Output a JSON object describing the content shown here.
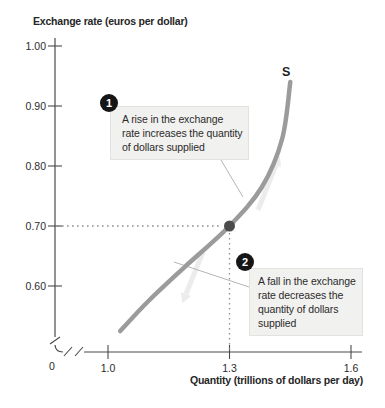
{
  "figure": {
    "y_axis_title": "Exchange rate (euros per dollar)",
    "x_axis_title": "Quantity (trillions of dollars per day)",
    "curve_label": "S",
    "origin_label": "0",
    "annotations": [
      {
        "number": "1",
        "lines": [
          "A rise in the exchange",
          "rate increases the quantity",
          "of dollars supplied"
        ]
      },
      {
        "number": "2",
        "lines": [
          "A fall in the exchange",
          "rate decreases the",
          "quantity of dollars",
          "supplied"
        ]
      }
    ]
  },
  "chart_data": {
    "type": "line",
    "title": "",
    "xlabel": "Quantity (trillions of dollars per day)",
    "ylabel": "Exchange rate (euros per dollar)",
    "xlim": [
      1.0,
      1.6
    ],
    "ylim": [
      0.55,
      1.0
    ],
    "axis_break": true,
    "grid": false,
    "x_ticks": [
      {
        "value": 1.0,
        "label": "1.0"
      },
      {
        "value": 1.3,
        "label": "1.3"
      },
      {
        "value": 1.6,
        "label": "1.6"
      }
    ],
    "y_ticks": [
      {
        "value": 1.0,
        "label": "1.00"
      },
      {
        "value": 0.9,
        "label": "0.90"
      },
      {
        "value": 0.8,
        "label": "0.80"
      },
      {
        "value": 0.7,
        "label": "0.70"
      },
      {
        "value": 0.6,
        "label": "0.60"
      }
    ],
    "series": [
      {
        "name": "S",
        "points": [
          [
            1.03,
            0.525
          ],
          [
            1.1,
            0.575
          ],
          [
            1.19,
            0.632
          ],
          [
            1.3,
            0.7
          ],
          [
            1.38,
            0.765
          ],
          [
            1.43,
            0.845
          ],
          [
            1.45,
            0.94
          ]
        ]
      }
    ],
    "highlight_point": {
      "x": 1.3,
      "y": 0.7
    },
    "guide_lines": {
      "x": 1.3,
      "y": 0.7
    },
    "colors": {
      "curve": "#9b9b9b",
      "dot": "#4c4c4c",
      "axis": "#4a4a4a",
      "guide": "#8f8f8f",
      "leader": "#b5b5b5",
      "flow_arrow": "#ececec",
      "annotation_bg": "#f1f1ef",
      "badge": "#161616"
    }
  }
}
